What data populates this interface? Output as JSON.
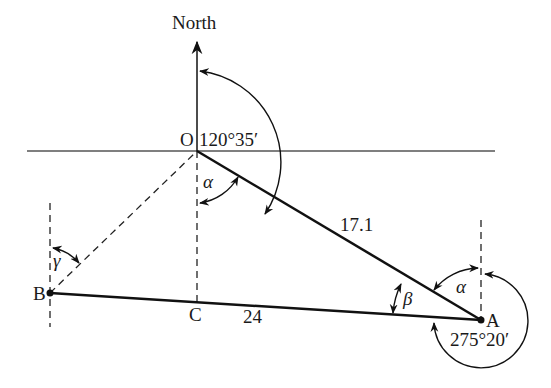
{
  "diagram": {
    "labels": {
      "north": "North",
      "point_o": "O",
      "point_a": "A",
      "point_b": "B",
      "point_c": "C",
      "bearing_oa": "120°35′",
      "bearing_ab": "275°20′",
      "length_oa": "17.1",
      "length_ab": "24",
      "angle_alpha_o": "α",
      "angle_alpha_a": "α",
      "angle_beta": "β",
      "angle_gamma": "γ"
    },
    "points": {
      "O": [
        197,
        151
      ],
      "A": [
        481,
        320
      ],
      "B": [
        50,
        293
      ],
      "C": [
        197,
        302
      ]
    },
    "colors": {
      "line": "#111111",
      "axis": "#444444",
      "background": "#ffffff"
    }
  }
}
